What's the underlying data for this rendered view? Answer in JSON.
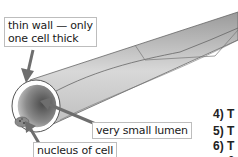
{
  "diagram": {
    "labels": {
      "wall": "thin wall — only one cell thick",
      "wall_line1": "thin wall — only",
      "wall_line2": "one cell thick",
      "lumen": "very small lumen",
      "nucleus": "nucleus of cell"
    },
    "question_numbers": [
      "4)",
      "5)",
      "6)"
    ],
    "partial_text": [
      "T",
      "T",
      "T",
      "c"
    ],
    "colors": {
      "tube_light": "#d9d9d9",
      "tube_dark": "#8c8c8c",
      "outline": "#555555",
      "arrow": "#6e6e6e"
    }
  }
}
